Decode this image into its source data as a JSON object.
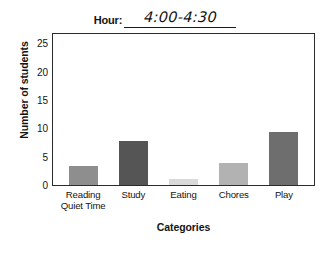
{
  "header": {
    "field_label": "Hour:",
    "field_value": "4:00-4:30"
  },
  "chart_data": {
    "type": "bar",
    "title": "",
    "subtitle": "",
    "xlabel": "Categories",
    "ylabel": "Number of students",
    "categories": [
      "Reading Quiet Time",
      "Study",
      "Eating",
      "Chores",
      "Play"
    ],
    "category_lines": [
      [
        "Reading",
        "Quiet Time"
      ],
      [
        "Study"
      ],
      [
        "Eating"
      ],
      [
        "Chores"
      ],
      [
        "Play"
      ]
    ],
    "values": [
      3.5,
      8,
      1,
      4,
      9.5
    ],
    "bar_colors": [
      "#8e8e8e",
      "#555555",
      "#d9d9d9",
      "#b2b2b2",
      "#6e6e6e"
    ],
    "ylim": [
      0,
      27
    ],
    "yticks": [
      0,
      5,
      10,
      15,
      20,
      25
    ],
    "ytick_labels": [
      "0",
      "5",
      "10",
      "15",
      "20",
      "25"
    ],
    "grid": false,
    "legend": false,
    "legend_position": "none"
  }
}
